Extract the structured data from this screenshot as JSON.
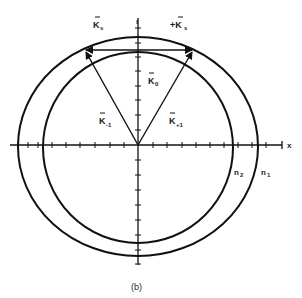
{
  "figure": {
    "caption": "(b)",
    "axis_x_label": "x",
    "axis_y_label": "ı",
    "labels": {
      "k_s_left": "K",
      "k_s_left_sub": "s",
      "k_s_right": "+K",
      "k_s_right_sub": "s",
      "k_0": "K",
      "k_0_sub": "0",
      "k_minus1": "K",
      "k_minus1_sub": "-1",
      "k_plus1": "K",
      "k_plus1_sub": "+1",
      "n_inner": "n",
      "n_inner_sub": "2",
      "n_outer": "n",
      "n_outer_sub": "1"
    },
    "colors": {
      "stroke": "#111111",
      "background": "#ffffff"
    }
  }
}
